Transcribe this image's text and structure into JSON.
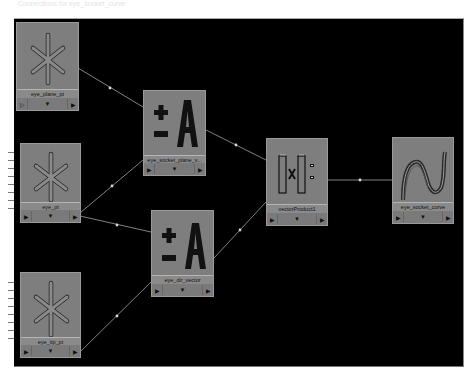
{
  "caption": "Connections for eye_socket_curve",
  "colors": {
    "canvas_bg": "#000000",
    "node_bg": "#7e7e7e",
    "wire": "#bdbdbd"
  },
  "nodes": [
    {
      "id": "eye_plane_pt",
      "label": "eye_plane_pt",
      "icon": "locator-asterisk-icon",
      "ports": {
        "in": "▷",
        "mid": "▼",
        "out": "▶"
      }
    },
    {
      "id": "eye_pt",
      "label": "eye_pt",
      "icon": "locator-asterisk-icon",
      "ports": {
        "in": "▶",
        "mid": "▼",
        "out": "▶"
      }
    },
    {
      "id": "eye_tip_pt",
      "label": "eye_tip_pt",
      "icon": "locator-asterisk-icon",
      "ports": {
        "in": "▶",
        "mid": "▼",
        "out": "▶"
      }
    },
    {
      "id": "eye_socket_plane_v",
      "label": "eye_socket_plane_v...",
      "icon": "plus-minus-average-icon",
      "ports": {
        "in": "▶",
        "mid": "▼",
        "out": "▶"
      }
    },
    {
      "id": "eye_dir_vector",
      "label": "eye_dir_vector",
      "icon": "plus-minus-average-icon",
      "ports": {
        "in": "▶",
        "mid": "▼",
        "out": "▶"
      }
    },
    {
      "id": "vectorProduct1",
      "label": "vectorProduct1",
      "icon": "vector-product-icon",
      "ports": {
        "in": "▶",
        "mid": "▼",
        "out": "▶"
      }
    },
    {
      "id": "eye_socket_curve",
      "label": "eye_socket_curve",
      "icon": "nurbs-curve-icon",
      "ports": {
        "in": "▶",
        "mid": "▼",
        "out": "▶"
      }
    }
  ],
  "connections": [
    {
      "from": "eye_plane_pt",
      "to": "eye_socket_plane_v"
    },
    {
      "from": "eye_pt",
      "to": "eye_socket_plane_v"
    },
    {
      "from": "eye_pt",
      "to": "eye_dir_vector"
    },
    {
      "from": "eye_tip_pt",
      "to": "eye_dir_vector"
    },
    {
      "from": "eye_socket_plane_v",
      "to": "vectorProduct1"
    },
    {
      "from": "eye_dir_vector",
      "to": "vectorProduct1"
    },
    {
      "from": "vectorProduct1",
      "to": "eye_socket_curve"
    }
  ]
}
